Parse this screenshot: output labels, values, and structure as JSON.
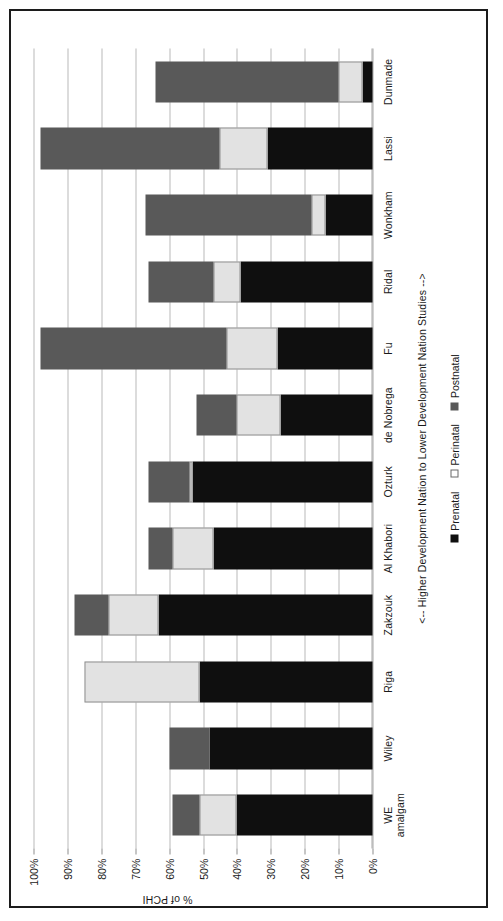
{
  "chart_data": {
    "type": "bar",
    "subtype": "stacked-bar-100",
    "title": "",
    "xlabel": "<-- Higher Development Nation  to  Lower Development Nation Studies -->",
    "ylabel": "% of PCHI",
    "ylim": [
      0,
      100
    ],
    "ytick_labels": [
      "0%",
      "10%",
      "20%",
      "30%",
      "40%",
      "50%",
      "60%",
      "70%",
      "80%",
      "90%",
      "100%"
    ],
    "ytick_values": [
      0,
      10,
      20,
      30,
      40,
      50,
      60,
      70,
      80,
      90,
      100
    ],
    "grid": true,
    "legend_position": "bottom",
    "orientation": "rotated-90-ccw",
    "categories": [
      "WE amalgam",
      "Wiley",
      "Riga",
      "Zakzouk",
      "Al Khabori",
      "Ozturk",
      "de Nobrega",
      "Fu",
      "Ridal",
      "Wonkham",
      "Lassi",
      "Dunmade"
    ],
    "series": [
      {
        "name": "Prenatal",
        "color": "#0f0f0f",
        "values": [
          40,
          48,
          51,
          63,
          47,
          53,
          27,
          28,
          39,
          14,
          31,
          3
        ]
      },
      {
        "name": "Perinatal",
        "color": "#e2e2e2",
        "values": [
          11,
          0,
          34,
          15,
          12,
          1,
          13,
          15,
          8,
          4,
          14,
          7
        ]
      },
      {
        "name": "Postnatal",
        "color": "#595959",
        "values": [
          8,
          12,
          0,
          10,
          7,
          12,
          12,
          55,
          19,
          49,
          53,
          54
        ]
      }
    ]
  },
  "axis": {
    "y_title": "% of PCHI",
    "x_caption": "<-- Higher Development Nation  to  Lower Development Nation Studies -->"
  },
  "legend": {
    "items": [
      {
        "label": "Prenatal",
        "swatch": "prenatal"
      },
      {
        "label": "Perinatal",
        "swatch": "perinatal"
      },
      {
        "label": "Postnatal",
        "swatch": "postnatal"
      }
    ]
  },
  "colors": {
    "prenatal": "#0f0f0f",
    "perinatal": "#e2e2e2",
    "postnatal": "#595959",
    "gridline": "#b9b9b9",
    "frame": "#1c1c1c",
    "text": "#1a1a1a"
  }
}
